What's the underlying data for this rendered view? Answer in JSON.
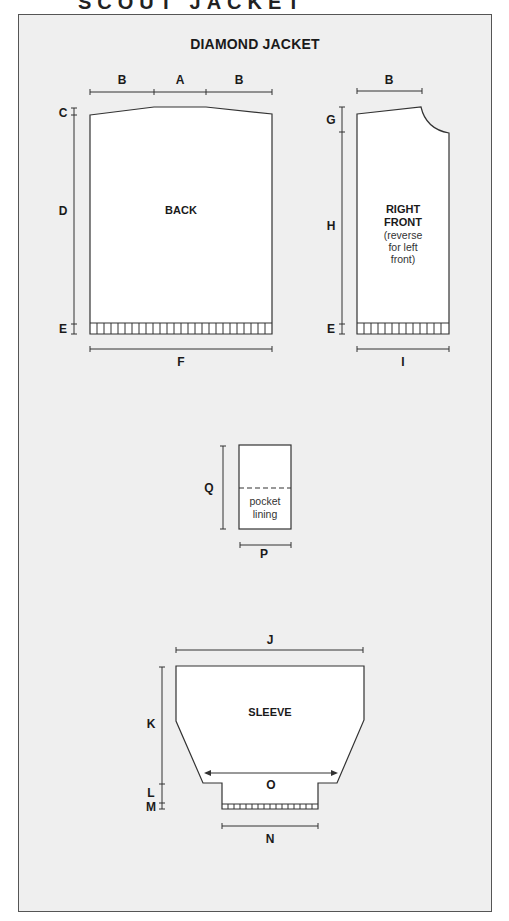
{
  "header": {
    "cut_text": "SCOUT JACKET"
  },
  "diagram": {
    "title": "DIAMOND JACKET",
    "pieces": {
      "back": {
        "label": "BACK"
      },
      "right_front": {
        "label_line1": "RIGHT",
        "label_line2": "FRONT",
        "note_line1": "(reverse",
        "note_line2": "for left",
        "note_line3": "front)"
      },
      "pocket": {
        "note_line1": "pocket",
        "note_line2": "lining"
      },
      "sleeve": {
        "label": "SLEEVE"
      }
    },
    "measurements": {
      "A": "A",
      "B": "B",
      "C": "C",
      "D": "D",
      "E": "E",
      "F": "F",
      "G": "G",
      "H": "H",
      "I": "I",
      "J": "J",
      "K": "K",
      "L": "L",
      "M": "M",
      "N": "N",
      "O": "O",
      "P": "P",
      "Q": "Q"
    }
  }
}
